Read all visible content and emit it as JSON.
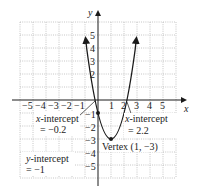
{
  "chart_data": {
    "type": "line",
    "title": "",
    "xlabel": "x",
    "ylabel": "y",
    "xlim": [
      -6,
      6
    ],
    "ylim": [
      -6,
      6
    ],
    "grid": true,
    "x_ticks": [
      "-5",
      "-4",
      "-3",
      "-2",
      "-1",
      "1",
      "2",
      "3",
      "4",
      "5"
    ],
    "y_ticks": [
      "5",
      "4",
      "3",
      "2",
      "-1",
      "-2",
      "-3",
      "-4",
      "-5"
    ],
    "series": [
      {
        "name": "y = 2(x-1)^2 - 3",
        "x": [
          -0.85,
          -0.5,
          -0.2,
          0,
          0.5,
          1,
          1.5,
          2,
          2.2,
          2.5,
          2.85
        ],
        "y": [
          3.85,
          1.5,
          -0.12,
          -1,
          -2.5,
          -3,
          -2.5,
          -1,
          -0.12,
          1.5,
          3.85
        ]
      }
    ],
    "points": [
      {
        "name": "vertex",
        "x": 1,
        "y": -3
      },
      {
        "name": "y-intercept",
        "x": 0,
        "y": -1
      }
    ],
    "annotations": [
      {
        "text_line1": "x-intercept",
        "text_line2": "= −0.2"
      },
      {
        "text_line1": "x-intercept",
        "text_line2": "= 2.2"
      },
      {
        "text_line1": "Vertex (1, −3)"
      },
      {
        "text_line1": "y-intercept",
        "text_line2": "= −1"
      }
    ]
  },
  "labels": {
    "x_axis": "x",
    "y_axis": "y",
    "xint_left_1": "x-intercept",
    "xint_left_2": "= −0.2",
    "xint_right_1": "x-intercept",
    "xint_right_2": "= 2.2",
    "vertex": "Vertex (1, −3)",
    "yint_1": "y-intercept",
    "yint_2": "= −1",
    "xt_m5": "−5",
    "xt_m4": "−4",
    "xt_m3": "−3",
    "xt_m2": "−2",
    "xt_m1": "−1",
    "xt_1": "1",
    "xt_2": "2",
    "xt_3": "3",
    "xt_4": "4",
    "xt_5": "5",
    "yt_5": "5",
    "yt_4": "4",
    "yt_3": "3",
    "yt_2": "2",
    "yt_m1": "−1",
    "yt_m2": "−2",
    "yt_m3": "−3",
    "yt_m4": "−4",
    "yt_m5": "−5"
  },
  "colors": {
    "curve": "#1a1a1a",
    "grid": "#b8b8b8",
    "axis": "#1a1a1a"
  }
}
